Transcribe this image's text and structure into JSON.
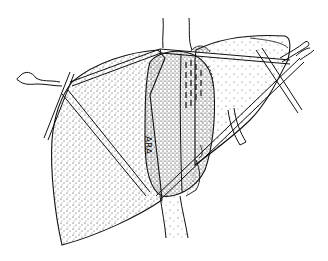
{
  "figure": {
    "type": "medical line illustration",
    "style": "black ink stipple on white",
    "labels": [
      {
        "text": "ARA",
        "orientation": "vertical",
        "position": "central vessel, left half"
      }
    ],
    "colors": {
      "background": "#ffffff",
      "ink": "#111111"
    }
  }
}
